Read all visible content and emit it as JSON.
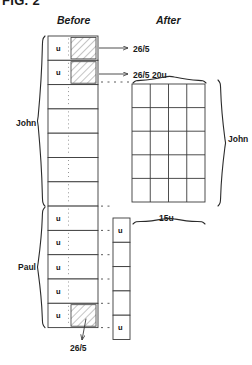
{
  "figure": {
    "title": "FIG. 2",
    "headers": {
      "before": "Before",
      "after": "After"
    }
  },
  "labels": {
    "john_left": "John",
    "paul_left": "Paul",
    "john_right": "John",
    "width_top": "20u",
    "width_bottom": "15u",
    "callout_top": "26/5",
    "callout_second": "26/5",
    "callout_bottom": "26/5"
  },
  "before_column": {
    "john_cells": [
      {
        "text": "u",
        "hatched": true
      },
      {
        "text": "u",
        "hatched": true
      },
      {
        "text": "",
        "hatched": false
      },
      {
        "text": "",
        "hatched": false
      },
      {
        "text": "",
        "hatched": false
      },
      {
        "text": "",
        "hatched": false
      },
      {
        "text": "",
        "hatched": false
      }
    ],
    "paul_cells": [
      {
        "text": "u",
        "hatched": false
      },
      {
        "text": "u",
        "hatched": false
      },
      {
        "text": "u",
        "hatched": false
      },
      {
        "text": "u",
        "hatched": false
      },
      {
        "text": "u",
        "hatched": true
      }
    ]
  },
  "after_area": {
    "john_grid": {
      "columns": 4,
      "rows": 5
    },
    "paul_column": {
      "cells": [
        {
          "text": "u"
        },
        {
          "text": ""
        },
        {
          "text": ""
        },
        {
          "text": ""
        },
        {
          "text": "u"
        }
      ]
    }
  }
}
